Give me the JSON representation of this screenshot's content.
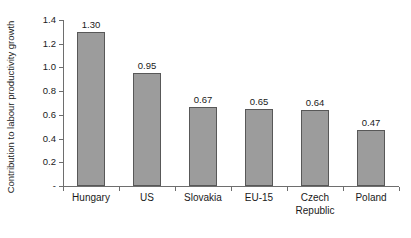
{
  "chart_data": {
    "type": "bar",
    "title": "",
    "xlabel": "",
    "ylabel": "Contribution to labour productivity growth",
    "categories": [
      "Hungary",
      "US",
      "Slovakia",
      "EU-15",
      "Czech Republic",
      "Poland"
    ],
    "values": [
      1.3,
      0.95,
      0.67,
      0.65,
      0.64,
      0.47
    ],
    "value_labels": [
      "1.30",
      "0.95",
      "0.67",
      "0.65",
      "0.64",
      "0.47"
    ],
    "ylim": [
      0,
      1.4
    ],
    "ytick_values": [
      1.4,
      1.2,
      1.0,
      0.8,
      0.6,
      0.4,
      0.2,
      0
    ],
    "ytick_labels": [
      "1.4",
      "1.2",
      "1.0",
      "0.8",
      "0.6",
      "0.4",
      "0.2",
      "-"
    ],
    "grid": false,
    "legend": false,
    "legend_position": "none",
    "bar_fill_color": "#9c9c9c",
    "bar_border_color": "#585858",
    "axis_color": "#6e6e6e",
    "text_color": "#1a1a1a",
    "background_color": "#ffffff"
  },
  "category_label_lines": [
    [
      "Hungary"
    ],
    [
      "US"
    ],
    [
      "Slovakia"
    ],
    [
      "EU-15"
    ],
    [
      "Czech",
      "Republic"
    ],
    [
      "Poland"
    ]
  ]
}
